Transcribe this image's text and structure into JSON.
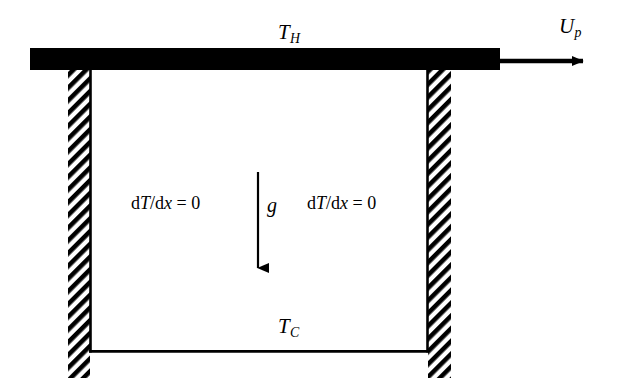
{
  "figure": {
    "type": "schematic-diagram",
    "width": 617,
    "height": 385,
    "background_color": "#ffffff",
    "stroke_color": "#000000"
  },
  "labels": {
    "hot_wall": {
      "symbol": "T",
      "subscript": "H",
      "text": "TH"
    },
    "cold_wall": {
      "symbol": "T",
      "subscript": "C",
      "text": "TC"
    },
    "lid_velocity": {
      "symbol": "U",
      "subscript": "p",
      "text": "Up"
    },
    "gravity": {
      "symbol": "g",
      "text": "g"
    },
    "bc_left": {
      "d1": "d",
      "var1": "T",
      "slash": "/",
      "d2": "d",
      "var2": "x",
      "eq": " = 0",
      "text": "dT/dx = 0"
    },
    "bc_right": {
      "d1": "d",
      "var1": "T",
      "slash": "/",
      "d2": "d",
      "var2": "x",
      "eq": " = 0",
      "text": "dT/dx = 0"
    }
  },
  "geometry": {
    "lid_bar": {
      "x": 30,
      "y": 48,
      "width": 470,
      "height": 22,
      "fill": "#000000"
    },
    "velocity_arrow": {
      "x1": 500,
      "y1": 61,
      "x2": 594,
      "y2": 61
    },
    "left_wall": {
      "x": 68,
      "y": 70,
      "width": 22,
      "height": 308
    },
    "right_wall": {
      "x": 428,
      "y": 70,
      "width": 23,
      "height": 308
    },
    "cavity": {
      "left": 90,
      "right": 428,
      "top": 70,
      "bottom": 352
    },
    "gravity_arrow": {
      "x": 258,
      "y1": 172,
      "y2": 279
    },
    "hatch_angle_deg": 45,
    "hatch_spacing": 9
  }
}
